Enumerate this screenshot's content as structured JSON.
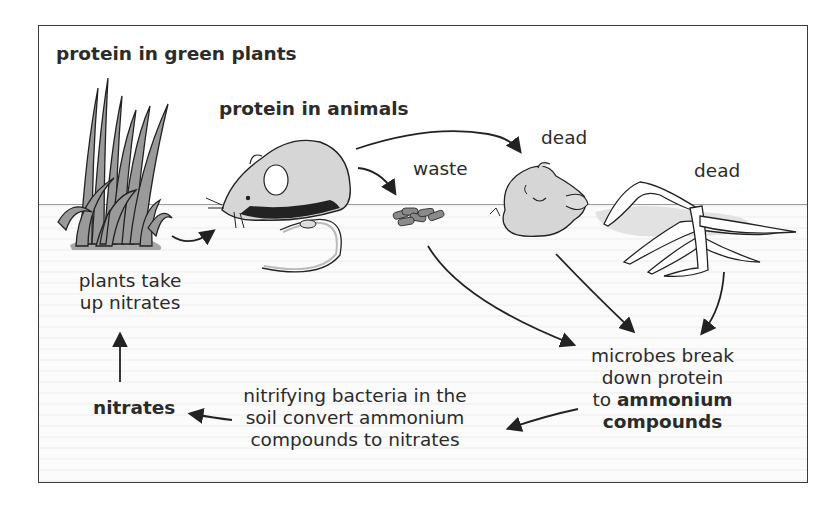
{
  "diagram": {
    "labels": {
      "protein_in_green_plants": "protein in green plants",
      "protein_in_animals": "protein in animals",
      "waste": "waste",
      "dead_animal": "dead",
      "dead_plant": "dead",
      "plants_take_up_line1": "plants take",
      "plants_take_up_line2": "up nitrates",
      "nitrates": "nitrates",
      "nitrifying_line1": "nitrifying bacteria in the",
      "nitrifying_line2": "soil convert ammonium",
      "nitrifying_line3": "compounds to nitrates",
      "microbes_line1": "microbes break",
      "microbes_line2": "down protein",
      "microbes_line3_prefix": "to",
      "microbes_line3_bold": "ammonium",
      "microbes_line4_bold": "compounds"
    },
    "illustrations": [
      "grass-clump",
      "mouse",
      "waste-pellets",
      "dead-mouse",
      "dead-plant"
    ],
    "flow": [
      {
        "from": "green plants",
        "to": "animals"
      },
      {
        "from": "animals",
        "to": "waste"
      },
      {
        "from": "animals",
        "to": "dead animal"
      },
      {
        "from": "waste",
        "to": "microbes"
      },
      {
        "from": "dead animal",
        "to": "microbes"
      },
      {
        "from": "dead plant",
        "to": "microbes"
      },
      {
        "from": "microbes",
        "to": "nitrifying bacteria"
      },
      {
        "from": "nitrifying bacteria",
        "to": "nitrates"
      },
      {
        "from": "nitrates",
        "to": "plants take up nitrates"
      }
    ],
    "colors": {
      "line": "#2a2a2a",
      "plant_fill": "#9c9c9c",
      "animal_fill": "#d8d8d8",
      "soil_fill": "#f6f6f6"
    }
  }
}
